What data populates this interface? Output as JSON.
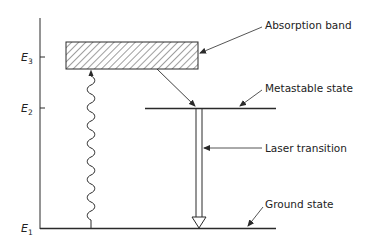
{
  "diagram": {
    "energy_levels": [
      {
        "id": "E3",
        "symbol": "E",
        "subscript": "3"
      },
      {
        "id": "E2",
        "symbol": "E",
        "subscript": "2"
      },
      {
        "id": "E1",
        "symbol": "E",
        "subscript": "1"
      }
    ],
    "labels": {
      "absorption_band": "Absorption band",
      "metastable_state": "Metastable state",
      "laser_transition": "Laser transition",
      "ground_state": "Ground state"
    },
    "colors": {
      "line": "#2a2a2a",
      "background": "#ffffff"
    }
  }
}
